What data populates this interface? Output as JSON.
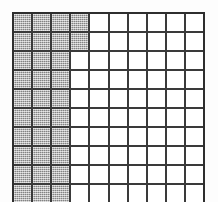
{
  "figure": {
    "type": "shaded-grid",
    "columns": 10,
    "rows": 10,
    "colors": {
      "background": "#fdfdfd",
      "grid_line": "#2e2e2e",
      "cell_empty": "#ffffff",
      "cell_shaded": "#a6a6a6"
    },
    "shaded_cell_count": 32,
    "empty_cell_count": 68,
    "shading_rule": "columns 1-3 shaded in every row; column 4 shaded only in rows 1-2",
    "cells": [
      [
        1,
        1,
        1,
        1,
        0,
        0,
        0,
        0,
        0,
        0
      ],
      [
        1,
        1,
        1,
        1,
        0,
        0,
        0,
        0,
        0,
        0
      ],
      [
        1,
        1,
        1,
        0,
        0,
        0,
        0,
        0,
        0,
        0
      ],
      [
        1,
        1,
        1,
        0,
        0,
        0,
        0,
        0,
        0,
        0
      ],
      [
        1,
        1,
        1,
        0,
        0,
        0,
        0,
        0,
        0,
        0
      ],
      [
        1,
        1,
        1,
        0,
        0,
        0,
        0,
        0,
        0,
        0
      ],
      [
        1,
        1,
        1,
        0,
        0,
        0,
        0,
        0,
        0,
        0
      ],
      [
        1,
        1,
        1,
        0,
        0,
        0,
        0,
        0,
        0,
        0
      ],
      [
        1,
        1,
        1,
        0,
        0,
        0,
        0,
        0,
        0,
        0
      ],
      [
        1,
        1,
        1,
        0,
        0,
        0,
        0,
        0,
        0,
        0
      ]
    ]
  }
}
